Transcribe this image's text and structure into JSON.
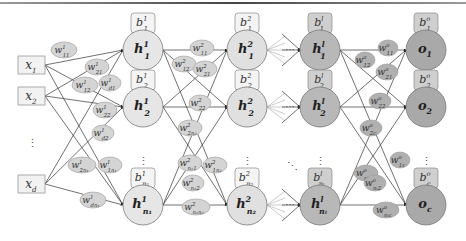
{
  "diagram": {
    "title": "",
    "colors": {
      "input_box_fill": "#f2f2f2",
      "input_box_stroke": "#9a9a9a",
      "layer1_fill": "#e6e6e6",
      "layer2_fill": "#e0e0e0",
      "layerl_fill": "#b8b8b8",
      "output_fill": "#a9a9a9",
      "weight_fill": "#d4d4d4",
      "weight_fill_dark": "#b0b0b0",
      "edge": "#333333",
      "edge_light": "#b5b5b5"
    },
    "inputs": [
      {
        "id": "x1",
        "label": "x",
        "sub": "1"
      },
      {
        "id": "x2",
        "label": "x",
        "sub": "2"
      },
      {
        "id": "xd",
        "label": "x",
        "sub": "d"
      }
    ],
    "input_ellipsis": "⋮",
    "layers": [
      {
        "name": "hidden-layer-1",
        "neurons": [
          {
            "label": "h",
            "sup": "1",
            "sub": "1",
            "bias": {
              "label": "b",
              "sup": "1",
              "sub": "1"
            }
          },
          {
            "label": "h",
            "sup": "1",
            "sub": "2",
            "bias": {
              "label": "b",
              "sup": "1",
              "sub": "2"
            }
          },
          {
            "label": "h",
            "sup": "1",
            "sub": "n₁",
            "bias": {
              "label": "b",
              "sup": "1",
              "sub": "n₁"
            }
          }
        ],
        "ellipsis": "⋮"
      },
      {
        "name": "hidden-layer-2",
        "neurons": [
          {
            "label": "h",
            "sup": "2",
            "sub": "1",
            "bias": {
              "label": "b",
              "sup": "2",
              "sub": "1"
            }
          },
          {
            "label": "h",
            "sup": "2",
            "sub": "2",
            "bias": {
              "label": "b",
              "sup": "2",
              "sub": "2"
            }
          },
          {
            "label": "h",
            "sup": "2",
            "sub": "n₂",
            "bias": {
              "label": "b",
              "sup": "2",
              "sub": "n₂"
            }
          }
        ],
        "ellipsis": "⋮"
      },
      {
        "name": "hidden-layer-l",
        "neurons": [
          {
            "label": "h",
            "sup": "l",
            "sub": "1",
            "bias": {
              "label": "b",
              "sup": "l",
              "sub": "1"
            }
          },
          {
            "label": "h",
            "sup": "l",
            "sub": "2",
            "bias": {
              "label": "b",
              "sup": "l",
              "sub": "2"
            }
          },
          {
            "label": "h",
            "sup": "l",
            "sub": "nₗ",
            "bias": {
              "label": "b",
              "sup": "l",
              "sub": "nₗ"
            }
          }
        ],
        "ellipsis": "⋮"
      },
      {
        "name": "output-layer",
        "neurons": [
          {
            "label": "o",
            "sup": "",
            "sub": "1",
            "bias": {
              "label": "b",
              "sup": "o",
              "sub": "1"
            }
          },
          {
            "label": "o",
            "sup": "",
            "sub": "2",
            "bias": {
              "label": "b",
              "sup": "o",
              "sub": "2"
            }
          },
          {
            "label": "o",
            "sup": "",
            "sub": "c",
            "bias": {
              "label": "b",
              "sup": "o",
              "sub": "c"
            }
          }
        ],
        "ellipsis": "⋮"
      }
    ],
    "weights_layer1": [
      {
        "label": "w",
        "sup": "1",
        "sub": "11"
      },
      {
        "label": "w",
        "sup": "1",
        "sub": "21"
      },
      {
        "label": "w",
        "sup": "1",
        "sub": "12"
      },
      {
        "label": "w",
        "sup": "1",
        "sub": "d1"
      },
      {
        "label": "w",
        "sup": "1",
        "sub": "22"
      },
      {
        "label": "w",
        "sup": "1",
        "sub": "d2"
      },
      {
        "label": "w",
        "sup": "1",
        "sub": "2n₁"
      },
      {
        "label": "w",
        "sup": "1",
        "sub": "1n₁"
      },
      {
        "label": "w",
        "sup": "1",
        "sub": "dn₁"
      }
    ],
    "weights_layer2": [
      {
        "label": "w",
        "sup": "2",
        "sub": "11"
      },
      {
        "label": "w",
        "sup": "2",
        "sub": "12"
      },
      {
        "label": "w",
        "sup": "2",
        "sub": "21"
      },
      {
        "label": "w",
        "sup": "2",
        "sub": "22"
      },
      {
        "label": "w",
        "sup": "2",
        "sub": "2n₂"
      },
      {
        "label": "w",
        "sup": "2",
        "sub": "n₁1"
      },
      {
        "label": "w",
        "sup": "2",
        "sub": "1n₂"
      },
      {
        "label": "w",
        "sup": "2",
        "sub": "n₁2"
      },
      {
        "label": "w",
        "sup": "2",
        "sub": "n₁n₂"
      }
    ],
    "weights_output": [
      {
        "label": "w",
        "sup": "o",
        "sub": "11"
      },
      {
        "label": "w",
        "sup": "o",
        "sub": "12"
      },
      {
        "label": "w",
        "sup": "o",
        "sub": "21"
      },
      {
        "label": "w",
        "sup": "o",
        "sub": "22"
      },
      {
        "label": "w",
        "sup": "o",
        "sub": "2c"
      },
      {
        "label": "w",
        "sup": "o",
        "sub": "nₗ1"
      },
      {
        "label": "w",
        "sup": "o",
        "sub": "1c"
      },
      {
        "label": "w",
        "sup": "o",
        "sub": "nₗ2"
      },
      {
        "label": "w",
        "sup": "o",
        "sub": "nₗc"
      }
    ],
    "between_layer_ellipsis": "···",
    "diagonal_ellipsis": "⋱"
  }
}
